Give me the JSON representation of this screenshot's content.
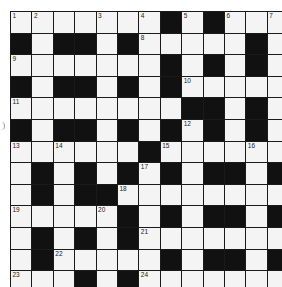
{
  "puzzle": {
    "rows": 13,
    "cols": 13,
    "grid": [
      [
        0,
        0,
        0,
        0,
        0,
        0,
        0,
        1,
        0,
        1,
        0,
        0,
        0
      ],
      [
        1,
        0,
        1,
        1,
        0,
        1,
        0,
        0,
        0,
        0,
        0,
        1,
        0
      ],
      [
        0,
        0,
        0,
        0,
        0,
        0,
        0,
        1,
        0,
        1,
        0,
        1,
        0
      ],
      [
        1,
        0,
        1,
        1,
        0,
        1,
        0,
        1,
        0,
        0,
        0,
        0,
        0
      ],
      [
        0,
        0,
        0,
        0,
        0,
        0,
        0,
        0,
        1,
        1,
        0,
        1,
        0
      ],
      [
        1,
        0,
        1,
        1,
        0,
        1,
        0,
        1,
        0,
        1,
        0,
        1,
        0
      ],
      [
        0,
        0,
        0,
        0,
        0,
        0,
        1,
        0,
        0,
        0,
        0,
        0,
        0
      ],
      [
        0,
        1,
        0,
        1,
        0,
        1,
        0,
        1,
        0,
        1,
        1,
        0,
        1
      ],
      [
        0,
        1,
        0,
        1,
        1,
        0,
        0,
        0,
        0,
        0,
        0,
        0,
        0
      ],
      [
        0,
        0,
        0,
        0,
        0,
        1,
        0,
        1,
        0,
        1,
        1,
        0,
        1
      ],
      [
        0,
        1,
        0,
        1,
        0,
        1,
        0,
        0,
        0,
        0,
        0,
        0,
        0
      ],
      [
        0,
        1,
        0,
        0,
        0,
        0,
        0,
        1,
        0,
        1,
        1,
        0,
        1
      ],
      [
        0,
        0,
        0,
        1,
        0,
        1,
        0,
        0,
        0,
        0,
        0,
        0,
        0
      ]
    ],
    "numbers": [
      {
        "r": 0,
        "c": 0,
        "n": "1"
      },
      {
        "r": 0,
        "c": 1,
        "n": "2"
      },
      {
        "r": 0,
        "c": 4,
        "n": "3"
      },
      {
        "r": 0,
        "c": 6,
        "n": "4"
      },
      {
        "r": 0,
        "c": 8,
        "n": "5"
      },
      {
        "r": 0,
        "c": 10,
        "n": "6"
      },
      {
        "r": 0,
        "c": 12,
        "n": "7"
      },
      {
        "r": 1,
        "c": 6,
        "n": "8"
      },
      {
        "r": 2,
        "c": 0,
        "n": "9"
      },
      {
        "r": 3,
        "c": 8,
        "n": "10"
      },
      {
        "r": 4,
        "c": 0,
        "n": "11"
      },
      {
        "r": 5,
        "c": 8,
        "n": "12"
      },
      {
        "r": 6,
        "c": 0,
        "n": "13"
      },
      {
        "r": 6,
        "c": 2,
        "n": "14"
      },
      {
        "r": 6,
        "c": 7,
        "n": "15"
      },
      {
        "r": 6,
        "c": 11,
        "n": "16"
      },
      {
        "r": 7,
        "c": 6,
        "n": "17"
      },
      {
        "r": 8,
        "c": 5,
        "n": "18"
      },
      {
        "r": 9,
        "c": 0,
        "n": "19"
      },
      {
        "r": 9,
        "c": 4,
        "n": "20"
      },
      {
        "r": 10,
        "c": 6,
        "n": "21"
      },
      {
        "r": 11,
        "c": 2,
        "n": "22"
      },
      {
        "r": 12,
        "c": 0,
        "n": "23"
      },
      {
        "r": 12,
        "c": 6,
        "n": "24"
      }
    ]
  },
  "colors": {
    "black_cell": "#111111",
    "white_cell": "#f4f4f4",
    "grid_line": "#1a1a1a"
  }
}
